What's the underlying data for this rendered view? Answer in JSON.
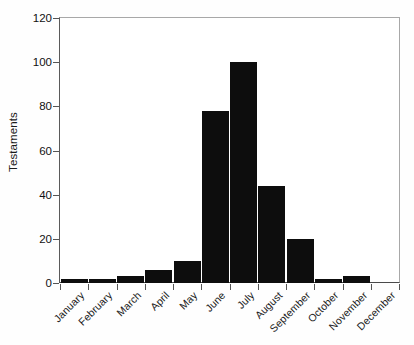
{
  "chart_data": {
    "type": "bar",
    "title": "",
    "xlabel": "",
    "ylabel": "Testaments",
    "categories": [
      "January",
      "February",
      "March",
      "April",
      "May",
      "June",
      "July",
      "August",
      "September",
      "October",
      "November",
      "December"
    ],
    "values": [
      2,
      2,
      3,
      6,
      10,
      78,
      100,
      44,
      20,
      2,
      3,
      0
    ],
    "ylim": [
      0,
      120
    ],
    "yticks": [
      0,
      20,
      40,
      60,
      80,
      100,
      120
    ],
    "ytick_labels": [
      "0",
      "20",
      "40",
      "60",
      "80",
      "100",
      "120"
    ],
    "grid": false,
    "legend": null,
    "bar_color": "#0d0d0d",
    "background_color": "#ffffff",
    "frame_color": "#9a9a9a",
    "axis_text_color": "#1a1a1a"
  }
}
